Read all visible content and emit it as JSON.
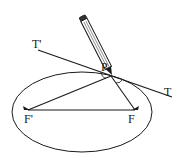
{
  "diagram": {
    "type": "ellipse-tangent-construction",
    "labels": {
      "tangent_left": "T'",
      "tangent_right": "T",
      "point": "P",
      "focus_left": "F'",
      "focus_right": "F"
    },
    "colors": {
      "stroke": "#1a1a1a",
      "background": "#ffffff"
    }
  }
}
